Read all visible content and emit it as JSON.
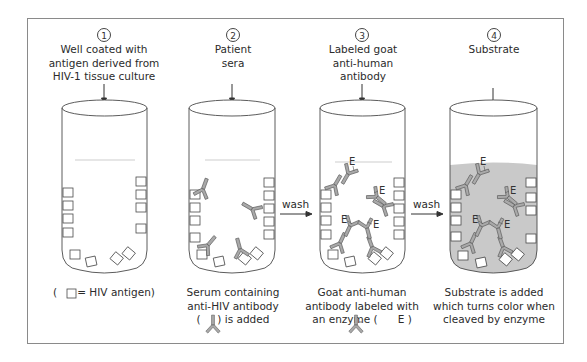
{
  "steps": [
    {
      "number": "1",
      "title_lines": [
        "Well coated with",
        "antigen derived from",
        "HIV-1 tissue culture"
      ],
      "caption_lines": [
        "(      = HIV antigen)"
      ]
    },
    {
      "number": "2",
      "title_lines": [
        "Patient",
        "sera"
      ],
      "caption_lines": [
        "Serum containing",
        "anti-HIV antibody",
        "(     ) is added"
      ]
    },
    {
      "number": "3",
      "title_lines": [
        "Labeled goat",
        "anti-human",
        "antibody"
      ],
      "caption_lines": [
        "Goat anti-human",
        "antibody labeled with",
        "an enzyme (      E )"
      ]
    },
    {
      "number": "4",
      "title_lines": [
        "Substrate"
      ],
      "caption_lines": [
        "Substrate is added",
        "which turns color when",
        "cleaved by enzyme"
      ]
    }
  ],
  "arrows": [
    {
      "label": "wash",
      "from_step": 2,
      "to_step": 3
    },
    {
      "label": "wash",
      "from_step": 3,
      "to_step": 4
    }
  ],
  "enzyme_label": "E",
  "legend": {
    "antigen_symbol": "square",
    "antigen_label": "HIV antigen",
    "antibody_symbol": "Y-shaped antibody",
    "enzyme_symbol": "E"
  },
  "colors": {
    "frame": "#8a8a8a",
    "line": "#4a4a4a",
    "antibody_fill": "#a9a9a9",
    "substrate_fill": "#c9c9c9",
    "text": "#2b2b2b"
  }
}
